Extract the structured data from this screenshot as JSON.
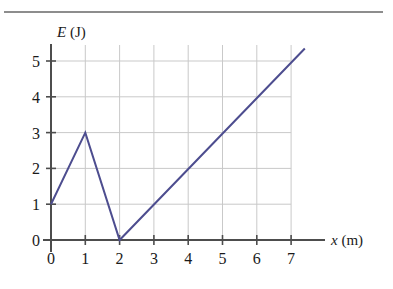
{
  "figure": {
    "background_color": "#ffffff",
    "top_rule_color": "#8d8d8d"
  },
  "chart_data": {
    "type": "line",
    "title": "",
    "subtitle": "",
    "xlabel": "x (m)",
    "xlabel_symbol": "x",
    "xlabel_unit": "(m)",
    "ylabel": "E (J)",
    "ylabel_symbol": "E",
    "ylabel_unit": "(J)",
    "xlim": [
      0,
      7.4
    ],
    "ylim": [
      0,
      5.4
    ],
    "xticks": [
      0,
      1,
      2,
      3,
      4,
      5,
      6,
      7
    ],
    "yticks": [
      0,
      1,
      2,
      3,
      4,
      5
    ],
    "xtick_labels": [
      "0",
      "1",
      "2",
      "3",
      "4",
      "5",
      "6",
      "7"
    ],
    "ytick_labels": [
      "0",
      "1",
      "2",
      "3",
      "4",
      "5"
    ],
    "grid": true,
    "grid_color": "#c9c9c9",
    "axis_color": "#4d4d4d",
    "legend": false,
    "legend_position": "none",
    "series": [
      {
        "name": "E(x)",
        "color": "#4d4d8f",
        "line_width": 2,
        "x": [
          0,
          1,
          2,
          7.4
        ],
        "values": [
          1,
          3,
          0,
          5.35
        ],
        "points": [
          {
            "x": 0,
            "y": 1
          },
          {
            "x": 1,
            "y": 3
          },
          {
            "x": 2,
            "y": 0
          },
          {
            "x": 7.4,
            "y": 5.35
          }
        ]
      }
    ],
    "annotations": []
  }
}
